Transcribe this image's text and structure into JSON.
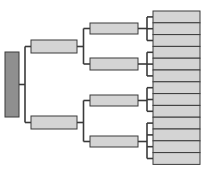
{
  "diagram": {
    "type": "tree",
    "orientation": "left-to-right",
    "colors": {
      "root_fill": "#8f8f8f",
      "node_fill": "#d4d4d4",
      "stroke": "#3a3a3a",
      "background": "#ffffff"
    },
    "root": {
      "label": "",
      "x": 5,
      "y": 52,
      "w": 14,
      "h": 65
    },
    "level1": [
      {
        "label": "",
        "x": 31,
        "y": 40,
        "w": 46,
        "h": 13
      },
      {
        "label": "",
        "x": 31,
        "y": 116,
        "w": 46,
        "h": 13
      }
    ],
    "level2": [
      {
        "label": "",
        "parent": 0,
        "x": 90,
        "y": 23,
        "w": 48,
        "h": 11
      },
      {
        "label": "",
        "parent": 0,
        "x": 90,
        "y": 58,
        "w": 48,
        "h": 12
      },
      {
        "label": "",
        "parent": 1,
        "x": 90,
        "y": 95,
        "w": 48,
        "h": 11
      },
      {
        "label": "",
        "parent": 1,
        "x": 90,
        "y": 136,
        "w": 48,
        "h": 11
      }
    ],
    "leaves": {
      "x": 153,
      "w": 47,
      "y_start": 11,
      "h": 11.8,
      "group_sizes": [
        3,
        3,
        3,
        4
      ],
      "count": 13
    }
  }
}
